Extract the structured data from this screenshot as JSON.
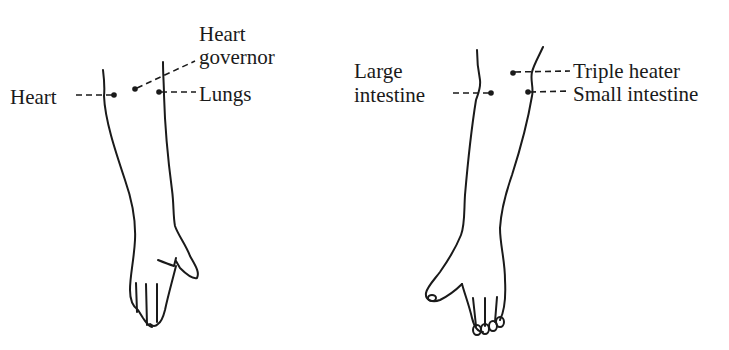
{
  "figure": {
    "left_arm": {
      "view": "palm-side forearm and hand",
      "labels": {
        "heart": "Heart",
        "heart_governor_line1": "Heart",
        "heart_governor_line2": "governor",
        "lungs": "Lungs"
      }
    },
    "right_arm": {
      "view": "back-side forearm and hand",
      "labels": {
        "large_intestine_line1": "Large",
        "large_intestine_line2": "intestine",
        "triple_heater": "Triple heater",
        "small_intestine": "Small intestine"
      }
    },
    "colors": {
      "ink": "#1a1a1a",
      "background": "#ffffff"
    }
  }
}
